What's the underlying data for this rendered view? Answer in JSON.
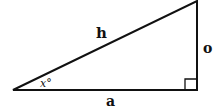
{
  "diagram": {
    "type": "right-triangle",
    "labels": {
      "hypotenuse": "h",
      "opposite": "o",
      "adjacent": "a",
      "angle": "x°"
    },
    "right_angle_marker": true,
    "stroke_color": "#111111"
  }
}
